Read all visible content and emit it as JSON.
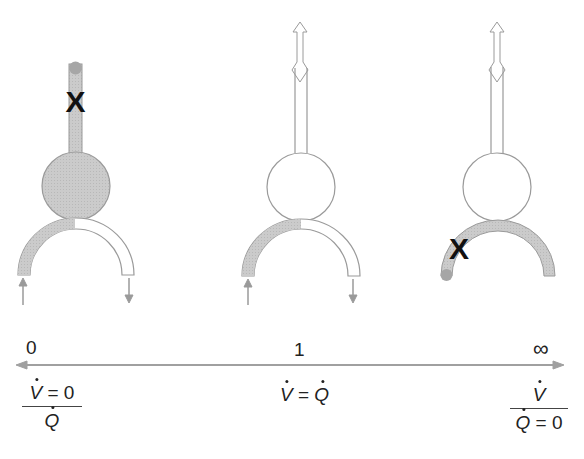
{
  "diagram": {
    "colors": {
      "outline": "#9a9a9a",
      "shaded_fill": "#c8c8c8",
      "cap_fill": "#a6a6a6",
      "marker": "#111111",
      "axis": "#a0a0a0",
      "text": "#222222"
    },
    "units": [
      {
        "id": "shunt",
        "alveolus_shaded": true,
        "airway_blocked": true,
        "blood_shaded": "left-half",
        "marker": "X",
        "marker_location": "airway"
      },
      {
        "id": "normal",
        "alveolus_shaded": false,
        "airway_blocked": false,
        "blood_shaded": "left-half",
        "airflow_arrow": "bidirectional"
      },
      {
        "id": "dead-space",
        "alveolus_shaded": false,
        "airway_blocked": false,
        "blood_shaded": "full",
        "marker": "X",
        "marker_location": "capillary",
        "airflow_arrow": "bidirectional"
      }
    ],
    "markers": {
      "shunt_x": "X",
      "deadspace_x": "X"
    },
    "scale": {
      "left_label": "0",
      "mid_label": "1",
      "right_label": "∞"
    },
    "formulas": {
      "left": {
        "num_var": "V",
        "num_rest": " = 0",
        "den_var": "Q",
        "den_rest": ""
      },
      "middle": {
        "lhs": "V",
        "op": " = ",
        "rhs": "Q"
      },
      "right": {
        "num_var": "V",
        "num_rest": "",
        "den_var": "Q",
        "den_rest": " = 0"
      }
    }
  }
}
